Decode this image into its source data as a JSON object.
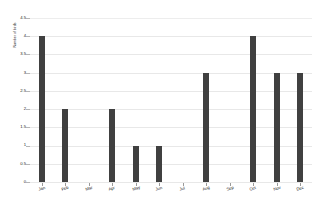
{
  "chart_data": {
    "type": "bar",
    "title": "",
    "subtitle": "",
    "xlabel": "",
    "ylabel": "Number of birds",
    "categories": [
      "Jan",
      "Feb",
      "Mar",
      "Apr",
      "May",
      "Jun",
      "Jul",
      "Aug",
      "Sep",
      "Oct",
      "Nov",
      "Dec"
    ],
    "values": [
      4,
      2,
      0,
      2,
      1,
      1,
      0,
      3,
      0,
      4,
      3,
      3
    ],
    "ylim": [
      0,
      4.5
    ],
    "ytick_labels": [
      "0",
      "0.5",
      "1",
      "1.5",
      "2",
      "2.5",
      "3",
      "3.5",
      "4",
      "4.5"
    ],
    "ytick_values": [
      0,
      0.5,
      1,
      1.5,
      2,
      2.5,
      3,
      3.5,
      4,
      4.5
    ],
    "grid": true,
    "legend": false,
    "legend_position": "none",
    "bar_color": "#404040",
    "gridline_color": "#e8e8e8",
    "axis_color": "#4a4a4a",
    "background_color": "#ffffff",
    "text_color": "#1a1a1a"
  }
}
